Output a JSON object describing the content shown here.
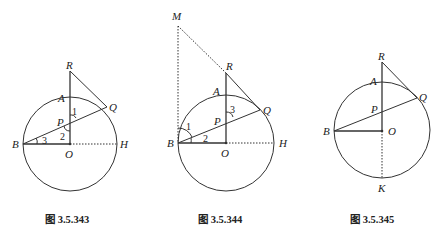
{
  "figures": [
    {
      "caption": "图 3.5.343",
      "points": {
        "R": "R",
        "A": "A",
        "Q": "Q",
        "P": "P",
        "B": "B",
        "O": "O",
        "H": "H"
      },
      "angles": {
        "a1": "1",
        "a2": "2",
        "a3": "3"
      }
    },
    {
      "caption": "图 3.5.344",
      "points": {
        "M": "M",
        "R": "R",
        "A": "A",
        "Q": "Q",
        "P": "P",
        "B": "B",
        "O": "O",
        "H": "H"
      },
      "angles": {
        "a1": "1",
        "a2": "2",
        "a3": "3"
      }
    },
    {
      "caption": "图 3.5.345",
      "points": {
        "R": "R",
        "A": "A",
        "Q": "Q",
        "P": "P",
        "B": "B",
        "O": "O",
        "K": "K"
      }
    }
  ]
}
